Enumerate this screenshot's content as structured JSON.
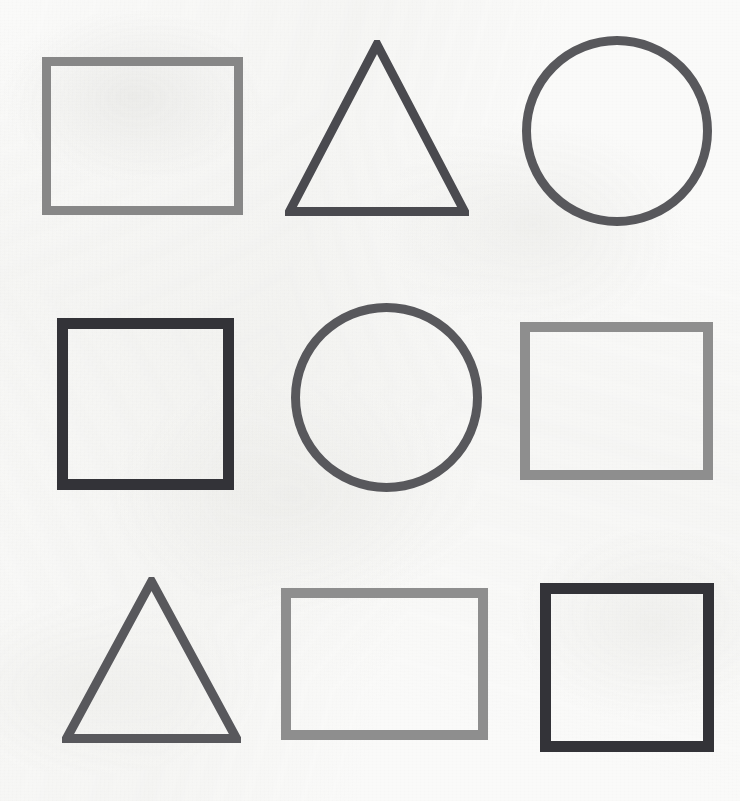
{
  "scene": {
    "title": "Geometric Shapes Grid",
    "description": "Three-by-three grid of outlined geometric shapes drawn on textured off-white paper",
    "width": 740,
    "height": 801,
    "background_color": "#fafaf9",
    "rows": 3,
    "columns": 3,
    "total_shapes": 9
  },
  "palette": {
    "paper": "#fafaf9",
    "light_gray": "#8e8e8e",
    "medium_gray": "#878787",
    "slate_gray": "#58585c",
    "dark_slate": "#4a4a4f",
    "near_black": "#333338"
  },
  "shapes": [
    {
      "id": "shape-1",
      "kind": "rectangle",
      "label": "Rectangle",
      "row": 1,
      "column": 1,
      "color": "#878787",
      "stroke": 9,
      "x": 42,
      "y": 57,
      "width": 201,
      "height": 158
    },
    {
      "id": "shape-2",
      "kind": "triangle",
      "label": "Triangle",
      "row": 1,
      "column": 2,
      "color": "#4a4a4f",
      "stroke": 9,
      "x": 285,
      "y": 40,
      "width": 184,
      "height": 176
    },
    {
      "id": "shape-3",
      "kind": "circle",
      "label": "Circle",
      "row": 1,
      "column": 3,
      "color": "#58585c",
      "stroke": 9,
      "x": 522,
      "y": 36,
      "width": 190,
      "height": 190
    },
    {
      "id": "shape-4",
      "kind": "square",
      "label": "Square",
      "row": 2,
      "column": 1,
      "color": "#333338",
      "stroke": 11,
      "x": 57,
      "y": 318,
      "width": 177,
      "height": 172
    },
    {
      "id": "shape-5",
      "kind": "circle",
      "label": "Circle",
      "row": 2,
      "column": 2,
      "color": "#58585c",
      "stroke": 9,
      "x": 291,
      "y": 303,
      "width": 191,
      "height": 189
    },
    {
      "id": "shape-6",
      "kind": "rectangle",
      "label": "Rectangle",
      "row": 2,
      "column": 3,
      "color": "#8e8e8e",
      "stroke": 10,
      "x": 520,
      "y": 322,
      "width": 193,
      "height": 158
    },
    {
      "id": "shape-7",
      "kind": "triangle",
      "label": "Triangle",
      "row": 3,
      "column": 1,
      "color": "#58585c",
      "stroke": 9,
      "x": 62,
      "y": 577,
      "width": 179,
      "height": 166
    },
    {
      "id": "shape-8",
      "kind": "rectangle",
      "label": "Rectangle",
      "row": 3,
      "column": 2,
      "color": "#8e8e8e",
      "stroke": 10,
      "x": 281,
      "y": 588,
      "width": 207,
      "height": 152
    },
    {
      "id": "shape-9",
      "kind": "square",
      "label": "Square",
      "row": 3,
      "column": 3,
      "color": "#333338",
      "stroke": 11,
      "x": 540,
      "y": 583,
      "width": 174,
      "height": 169
    }
  ]
}
